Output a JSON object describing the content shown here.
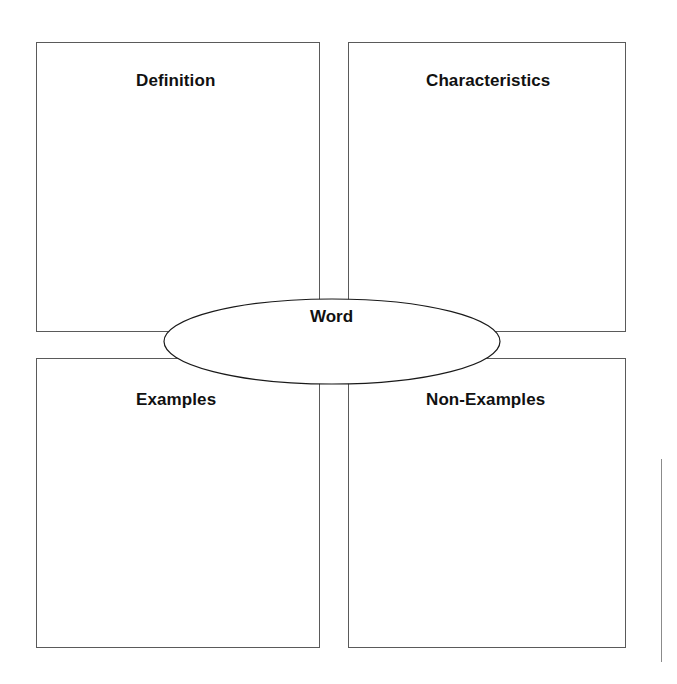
{
  "document": {
    "title": "Frayer Model Graphic Organizer",
    "type": "four-quadrant-concept-map"
  },
  "diagram": {
    "center": {
      "shape": "ellipse",
      "label": "Word"
    },
    "quadrants": [
      {
        "id": "definition",
        "label": "Definition",
        "position": "top-left",
        "content": ""
      },
      {
        "id": "characteristics",
        "label": "Characteristics",
        "position": "top-right",
        "content": ""
      },
      {
        "id": "examples",
        "label": "Examples",
        "position": "bottom-left",
        "content": ""
      },
      {
        "id": "non-examples",
        "label": "Non-Examples",
        "position": "bottom-right",
        "content": ""
      }
    ],
    "colors": {
      "background": "#ffffff",
      "stroke": "#5a5a5a",
      "ellipse_stroke": "#1a1a1a",
      "text": "#111111",
      "artifact_line": "#8b8b8b"
    }
  }
}
